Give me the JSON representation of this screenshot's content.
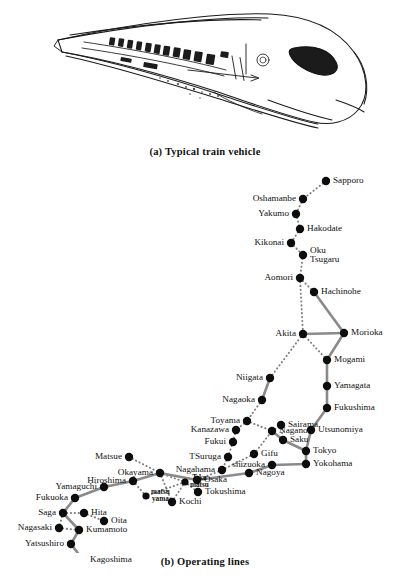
{
  "figure": {
    "panel_a": {
      "caption": "(a) Typical train vehicle",
      "subject": "high-speed shinkansen train vehicle line drawing"
    },
    "panel_b": {
      "caption": "(b) Operating lines"
    }
  },
  "map": {
    "width": 410,
    "height": 385,
    "legend": {
      "solid": "operating line",
      "dotted": "planned line"
    },
    "stations": [
      {
        "id": "sapporo",
        "label": "Sapporo",
        "x": 326,
        "y": 13,
        "side": "right"
      },
      {
        "id": "oshamanbe",
        "label": "Oshamanbe",
        "x": 303,
        "y": 31,
        "side": "left"
      },
      {
        "id": "yakumo",
        "label": "Yakumo",
        "x": 296,
        "y": 46,
        "side": "left"
      },
      {
        "id": "hakodate",
        "label": "Hakodate",
        "x": 300,
        "y": 61,
        "side": "right"
      },
      {
        "id": "kikonai",
        "label": "Kikonai",
        "x": 291,
        "y": 75,
        "side": "left"
      },
      {
        "id": "okutsugaru",
        "label": "Oku\nTsugaru",
        "x": 303,
        "y": 87,
        "side": "right"
      },
      {
        "id": "aomori",
        "label": "Aomori",
        "x": 300,
        "y": 110,
        "side": "left"
      },
      {
        "id": "hachinohe",
        "label": "Hachinohe",
        "x": 314,
        "y": 124,
        "side": "right"
      },
      {
        "id": "akita",
        "label": "Akita",
        "x": 303,
        "y": 166,
        "side": "left"
      },
      {
        "id": "morioka",
        "label": "Morioka",
        "x": 344,
        "y": 165,
        "side": "right"
      },
      {
        "id": "mogami",
        "label": "Mogami",
        "x": 327,
        "y": 192,
        "side": "right"
      },
      {
        "id": "yamagata",
        "label": "Yamagata",
        "x": 327,
        "y": 218,
        "side": "right"
      },
      {
        "id": "fukushima",
        "label": "Fukushima",
        "x": 327,
        "y": 240,
        "side": "right"
      },
      {
        "id": "niigata",
        "label": "Niigata",
        "x": 270,
        "y": 210,
        "side": "left"
      },
      {
        "id": "nagaoka",
        "label": "Nagaoka",
        "x": 262,
        "y": 232,
        "side": "left"
      },
      {
        "id": "utsunomiya",
        "label": "Utsunomiya",
        "x": 311,
        "y": 262,
        "side": "right"
      },
      {
        "id": "toyama",
        "label": "Toyama",
        "x": 247,
        "y": 253,
        "side": "left"
      },
      {
        "id": "kanazawa",
        "label": "Kanazawa",
        "x": 236,
        "y": 262,
        "side": "left"
      },
      {
        "id": "nagano",
        "label": "Nagano",
        "x": 272,
        "y": 263,
        "side": "right"
      },
      {
        "id": "sairama",
        "label": "Sairama",
        "x": 281,
        "y": 257,
        "side": "right"
      },
      {
        "id": "saku",
        "label": "Saku",
        "x": 283,
        "y": 272,
        "side": "right"
      },
      {
        "id": "fukui",
        "label": "Fukui",
        "x": 233,
        "y": 274,
        "side": "left"
      },
      {
        "id": "tsuruga",
        "label": "TSuruga",
        "x": 228,
        "y": 289,
        "side": "left"
      },
      {
        "id": "gifu",
        "label": "Gifu",
        "x": 254,
        "y": 286,
        "side": "right"
      },
      {
        "id": "nagahama",
        "label": "Nagahama",
        "x": 222,
        "y": 302,
        "side": "left"
      },
      {
        "id": "tokyo",
        "label": "Tokyo",
        "x": 306,
        "y": 283,
        "side": "right"
      },
      {
        "id": "yokohama",
        "label": "Yokohama",
        "x": 306,
        "y": 296,
        "side": "right"
      },
      {
        "id": "shizuoka",
        "label": "shizuoka",
        "x": 272,
        "y": 297,
        "side": "left"
      },
      {
        "id": "nagoya",
        "label": "Nagoya",
        "x": 249,
        "y": 305,
        "side": "right"
      },
      {
        "id": "osaka",
        "label": "Osaka",
        "x": 197,
        "y": 312,
        "side": "right"
      },
      {
        "id": "matsue",
        "label": "Matsue",
        "x": 129,
        "y": 289,
        "side": "left"
      },
      {
        "id": "okayama",
        "label": "Okayama",
        "x": 160,
        "y": 305,
        "side": "left"
      },
      {
        "id": "hiroshima",
        "label": "Hiroshima",
        "x": 133,
        "y": 313,
        "side": "left"
      },
      {
        "id": "tskamatsu",
        "label": "Tska\nmatsu",
        "x": 185,
        "y": 314,
        "side": "small"
      },
      {
        "id": "tokushima",
        "label": "Tokushima",
        "x": 198,
        "y": 324,
        "side": "right"
      },
      {
        "id": "yamaguchi",
        "label": "Yamaguchi",
        "x": 104,
        "y": 319,
        "side": "left"
      },
      {
        "id": "matsuyama",
        "label": "matsu\nyama",
        "x": 146,
        "y": 328,
        "side": "small"
      },
      {
        "id": "kochi",
        "label": "Kochi",
        "x": 172,
        "y": 334,
        "side": "right"
      },
      {
        "id": "fukuoka",
        "label": "Fukuoka",
        "x": 75,
        "y": 330,
        "side": "left"
      },
      {
        "id": "saga",
        "label": "Saga",
        "x": 63,
        "y": 345,
        "side": "left"
      },
      {
        "id": "hita",
        "label": "Hita",
        "x": 84,
        "y": 345,
        "side": "right"
      },
      {
        "id": "oita",
        "label": "Oita",
        "x": 104,
        "y": 353,
        "side": "right"
      },
      {
        "id": "nagasaki",
        "label": "Nagasaki",
        "x": 59,
        "y": 360,
        "side": "left"
      },
      {
        "id": "kumamoto",
        "label": "Kumamoto",
        "x": 79,
        "y": 362,
        "side": "right"
      },
      {
        "id": "yatsushiro",
        "label": "Yatsushiro",
        "x": 71,
        "y": 376,
        "side": "left"
      },
      {
        "id": "kagoshima",
        "label": "Kagoshima",
        "x": 83,
        "y": 392,
        "side": "right"
      }
    ],
    "solid_edges": [
      [
        "hachinohe",
        "morioka"
      ],
      [
        "akita",
        "morioka"
      ],
      [
        "morioka",
        "mogami"
      ],
      [
        "mogami",
        "yamagata"
      ],
      [
        "yamagata",
        "fukushima"
      ],
      [
        "fukushima",
        "utsunomiya"
      ],
      [
        "utsunomiya",
        "tokyo"
      ],
      [
        "niigata",
        "nagaoka"
      ],
      [
        "nagano",
        "saku"
      ],
      [
        "saku",
        "tokyo"
      ],
      [
        "tokyo",
        "yokohama"
      ],
      [
        "yokohama",
        "shizuoka"
      ],
      [
        "shizuoka",
        "nagoya"
      ],
      [
        "nagoya",
        "osaka"
      ],
      [
        "osaka",
        "okayama"
      ],
      [
        "okayama",
        "hiroshima"
      ],
      [
        "hiroshima",
        "yamaguchi"
      ],
      [
        "yamaguchi",
        "fukuoka"
      ],
      [
        "fukuoka",
        "saga"
      ],
      [
        "saga",
        "kumamoto"
      ],
      [
        "kumamoto",
        "yatsushiro"
      ],
      [
        "yatsushiro",
        "kagoshima"
      ]
    ],
    "dotted_edges": [
      [
        "sapporo",
        "oshamanbe"
      ],
      [
        "oshamanbe",
        "yakumo"
      ],
      [
        "yakumo",
        "hakodate"
      ],
      [
        "hakodate",
        "kikonai"
      ],
      [
        "kikonai",
        "okutsugaru"
      ],
      [
        "okutsugaru",
        "aomori"
      ],
      [
        "aomori",
        "hachinohe"
      ],
      [
        "aomori",
        "akita"
      ],
      [
        "akita",
        "niigata"
      ],
      [
        "akita",
        "mogami"
      ],
      [
        "niigata",
        "nagaoka"
      ],
      [
        "nagaoka",
        "toyama"
      ],
      [
        "toyama",
        "nagano"
      ],
      [
        "nagano",
        "sairama"
      ],
      [
        "sairama",
        "saku"
      ],
      [
        "toyama",
        "kanazawa"
      ],
      [
        "kanazawa",
        "fukui"
      ],
      [
        "fukui",
        "tsuruga"
      ],
      [
        "tsuruga",
        "nagahama"
      ],
      [
        "nagahama",
        "gifu"
      ],
      [
        "gifu",
        "nagano"
      ],
      [
        "nagahama",
        "osaka"
      ],
      [
        "matsue",
        "okayama"
      ],
      [
        "okayama",
        "tskamatsu"
      ],
      [
        "tskamatsu",
        "tokushima"
      ],
      [
        "tskamatsu",
        "kochi"
      ],
      [
        "tskamatsu",
        "matsuyama"
      ],
      [
        "matsuyama",
        "hiroshima"
      ],
      [
        "kochi",
        "okayama"
      ],
      [
        "saga",
        "nagasaki"
      ],
      [
        "nagasaki",
        "kumamoto"
      ],
      [
        "hita",
        "oita"
      ],
      [
        "saga",
        "hita"
      ]
    ]
  }
}
